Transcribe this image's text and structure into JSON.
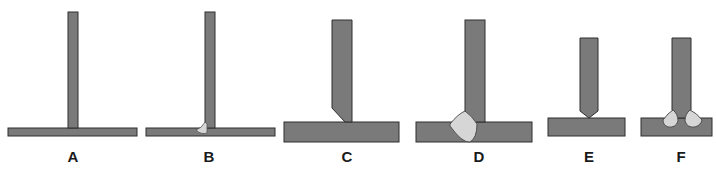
{
  "colors": {
    "metal": "#7a7a7a",
    "outline": "#2e2e2e",
    "weld": "#d6d6d6",
    "background": "#ffffff"
  },
  "joints": [
    {
      "id": "A",
      "label": "A",
      "description": "square T-joint, no weld"
    },
    {
      "id": "B",
      "label": "B",
      "description": "T-joint with small one-sided fillet weld"
    },
    {
      "id": "C",
      "label": "C",
      "description": "T-joint with single-bevel prepared member"
    },
    {
      "id": "D",
      "label": "D",
      "description": "single-bevel T-joint with weld deposit"
    },
    {
      "id": "E",
      "label": "E",
      "description": "T-joint with double-bevel prepared member"
    },
    {
      "id": "F",
      "label": "F",
      "description": "double-bevel T-joint with welds both sides"
    }
  ]
}
